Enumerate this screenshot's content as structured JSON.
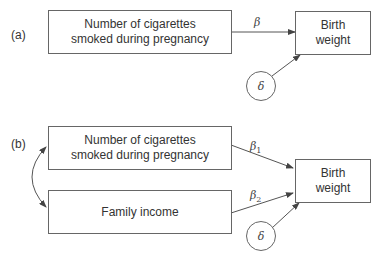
{
  "panel_a": {
    "label": "(a)",
    "predictor_box": {
      "line1": "Number of cigarettes",
      "line2": "smoked during pregnancy"
    },
    "outcome_box": {
      "line1": "Birth",
      "line2": "weight"
    },
    "path_coefficient": "β",
    "error_term": "δ"
  },
  "panel_b": {
    "label": "(b)",
    "predictor1_box": {
      "line1": "Number of cigarettes",
      "line2": "smoked during pregnancy"
    },
    "predictor2_box": {
      "label": "Family income"
    },
    "outcome_box": {
      "line1": "Birth",
      "line2": "weight"
    },
    "path_coefficient_1": {
      "symbol": "β",
      "subscript": "1"
    },
    "path_coefficient_2": {
      "symbol": "β",
      "subscript": "2"
    },
    "error_term": "δ",
    "correlation": "double-headed curved arrow between predictors"
  },
  "colors": {
    "line": "#555555",
    "text": "#333333",
    "background": "#ffffff"
  }
}
